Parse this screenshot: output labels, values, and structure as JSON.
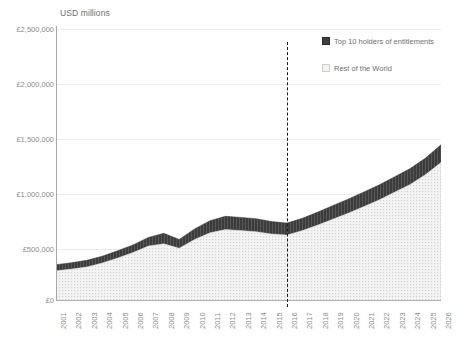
{
  "chart_data": {
    "type": "area",
    "stacked": true,
    "title": "",
    "axis_title": "USD millions",
    "xlabel": "",
    "ylabel": "USD millions",
    "ylim": [
      0,
      2500000
    ],
    "ytick_labels": [
      "£2,500,000",
      "£2,000,000",
      "£1,500,000",
      "£1,000,000",
      "£500,000",
      "£0"
    ],
    "ytick_values": [
      2500000,
      2000000,
      1500000,
      1000000,
      500000,
      0
    ],
    "grid": true,
    "legend_position": "top-right",
    "categories": [
      "2001",
      "2002",
      "2003",
      "2004",
      "2005",
      "2006",
      "2007",
      "2008",
      "2009",
      "2010",
      "2011",
      "2012",
      "2013",
      "2014",
      "2015",
      "2016",
      "2017",
      "2018",
      "2019",
      "2020",
      "2021",
      "2022",
      "2023",
      "2024",
      "2025",
      "2026"
    ],
    "series": [
      {
        "name": "Rest of the World",
        "color": "#f2f2f2",
        "pattern": "dotted-hatch",
        "values": [
          275000,
          290000,
          310000,
          345000,
          390000,
          440000,
          500000,
          520000,
          480000,
          560000,
          620000,
          650000,
          640000,
          630000,
          610000,
          600000,
          640000,
          690000,
          745000,
          800000,
          860000,
          920000,
          990000,
          1060000,
          1150000,
          1260000
        ]
      },
      {
        "name": "Top 10 holders of entitlements",
        "color": "#3f3f3f",
        "pattern": "solid-dark",
        "values": [
          55000,
          58000,
          60000,
          62000,
          66000,
          70000,
          78000,
          95000,
          80000,
          95000,
          110000,
          120000,
          120000,
          118000,
          112000,
          108000,
          112000,
          118000,
          124000,
          128000,
          132000,
          136000,
          140000,
          144000,
          150000,
          160000
        ]
      }
    ],
    "totals": [
      330000,
      348000,
      370000,
      407000,
      456000,
      510000,
      578000,
      615000,
      560000,
      655000,
      730000,
      770000,
      760000,
      748000,
      722000,
      708000,
      752000,
      808000,
      869000,
      928000,
      992000,
      1056000,
      1130000,
      1204000,
      1300000,
      1420000
    ],
    "annotations": [
      {
        "type": "vertical-dashed-line",
        "at_category": "2016",
        "style": "forecast-divider"
      }
    ],
    "legend": [
      {
        "label": "Top 10 holders of entitlements",
        "swatch": "dark"
      },
      {
        "label": "Rest of the World",
        "swatch": "light"
      }
    ]
  }
}
